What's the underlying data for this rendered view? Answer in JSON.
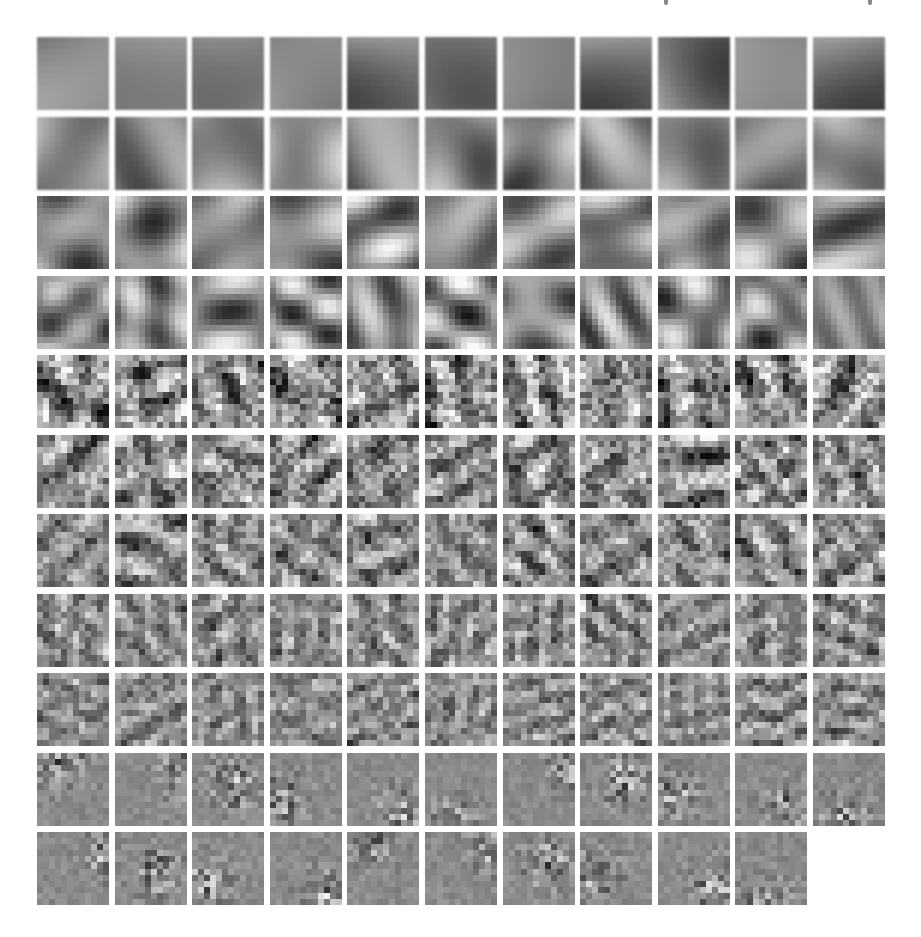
{
  "figure": {
    "grid": {
      "columns": 11,
      "rows": 11,
      "tile_count": 120,
      "tile_size_px": [
        72,
        73
      ],
      "block_resolution": 12,
      "origin_px": [
        37,
        37
      ],
      "pitch_px": [
        77.6,
        79.5
      ],
      "last_row_tiles": 10
    },
    "colors": {
      "background": "#ffffff",
      "mid_gray": "#8a8a8a",
      "dark": "#111111",
      "light": "#f4f4f4"
    },
    "top_clipped_text_marks": [
      {
        "x": 664,
        "label": "descender"
      },
      {
        "x": 868,
        "label": "descender"
      }
    ],
    "rows": [
      {
        "row": 0,
        "frequency": 0.6,
        "contrast": 0.55,
        "smooth": "smooth",
        "seed": 11
      },
      {
        "row": 1,
        "frequency": 1.3,
        "contrast": 0.65,
        "smooth": "smooth",
        "seed": 23
      },
      {
        "row": 2,
        "frequency": 2.1,
        "contrast": 0.7,
        "smooth": "mid",
        "seed": 37
      },
      {
        "row": 3,
        "frequency": 2.8,
        "contrast": 0.75,
        "smooth": "mid",
        "seed": 41
      },
      {
        "row": 4,
        "frequency": 3.5,
        "contrast": 0.7,
        "smooth": "sharp",
        "seed": 53
      },
      {
        "row": 5,
        "frequency": 4.2,
        "contrast": 0.65,
        "smooth": "sharp",
        "seed": 67
      },
      {
        "row": 6,
        "frequency": 4.8,
        "contrast": 0.55,
        "smooth": "sharp",
        "seed": 71
      },
      {
        "row": 7,
        "frequency": 5.3,
        "contrast": 0.5,
        "smooth": "sharp",
        "seed": 83
      },
      {
        "row": 8,
        "frequency": 5.7,
        "contrast": 0.45,
        "smooth": "sharp",
        "seed": 97
      },
      {
        "row": 9,
        "frequency": 6.0,
        "contrast": 0.4,
        "smooth": "sharp",
        "checker": true,
        "seed": 101
      },
      {
        "row": 10,
        "frequency": 6.0,
        "contrast": 0.4,
        "smooth": "sharp",
        "checker": true,
        "seed": 113
      }
    ]
  }
}
